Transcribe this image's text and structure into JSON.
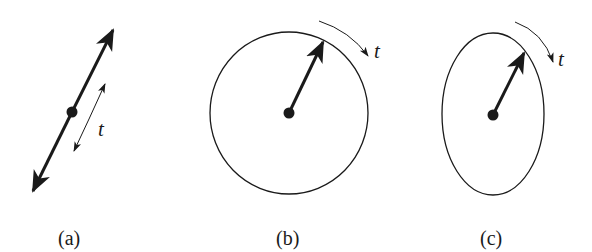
{
  "panels": [
    {
      "id": "a",
      "label": "(a)",
      "shape": "line",
      "annotation": "t",
      "description": "double-headed vector along a line through a point; thin double arrow labeled t"
    },
    {
      "id": "b",
      "label": "(b)",
      "shape": "circle",
      "annotation": "t",
      "description": "vector from center to circle; curved arrow labeled t indicating rotation"
    },
    {
      "id": "c",
      "label": "(c)",
      "shape": "ellipse",
      "annotation": "t",
      "description": "vector from center to ellipse; curved arrow labeled t indicating rotation"
    }
  ],
  "colors": {
    "ink": "#1a1a1a",
    "background": "#ffffff"
  }
}
